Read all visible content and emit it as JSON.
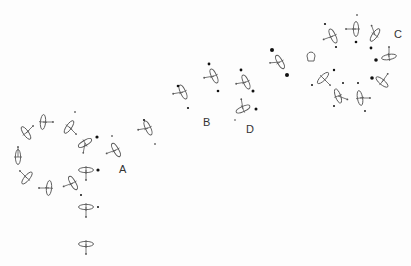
{
  "figure": {
    "labels": [
      {
        "text": "A",
        "x": 119,
        "y": 164
      },
      {
        "text": "B",
        "x": 203,
        "y": 117
      },
      {
        "text": "D",
        "x": 246,
        "y": 124
      },
      {
        "text": "C",
        "x": 394,
        "y": 29
      }
    ],
    "glyphs": [
      {
        "x": 18,
        "y": 157,
        "rot": 90,
        "lineAngle": -90
      },
      {
        "x": 26,
        "y": 133,
        "rot": 55,
        "lineAngle": -45
      },
      {
        "x": 43,
        "y": 122,
        "rot": 95,
        "lineAngle": 0
      },
      {
        "x": 69,
        "y": 127,
        "rot": 125,
        "lineAngle": 45
      },
      {
        "x": 85,
        "y": 143,
        "rot": 150,
        "lineAngle": 100
      },
      {
        "x": 116,
        "y": 150,
        "rot": 60,
        "lineAngle": 160
      },
      {
        "x": 86,
        "y": 170,
        "rot": 0,
        "lineAngle": 90
      },
      {
        "x": 73,
        "y": 183,
        "rot": 60,
        "lineAngle": 160
      },
      {
        "x": 49,
        "y": 188,
        "rot": 95,
        "lineAngle": 180
      },
      {
        "x": 27,
        "y": 178,
        "rot": 130,
        "lineAngle": -135
      },
      {
        "x": 86,
        "y": 207,
        "rot": 0,
        "lineAngle": 90
      },
      {
        "x": 86,
        "y": 244,
        "rot": 0,
        "lineAngle": 90
      },
      {
        "x": 148,
        "y": 128,
        "rot": 65,
        "lineAngle": 170
      },
      {
        "x": 183,
        "y": 92,
        "rot": 65,
        "lineAngle": 170
      },
      {
        "x": 214,
        "y": 76,
        "rot": 65,
        "lineAngle": 170
      },
      {
        "x": 243,
        "y": 109,
        "rot": -25,
        "lineAngle": -100
      },
      {
        "x": 246,
        "y": 82,
        "rot": 65,
        "lineAngle": 170
      },
      {
        "x": 280,
        "y": 62,
        "rot": 60,
        "lineAngle": 175
      },
      {
        "x": 333,
        "y": 36,
        "rot": 65,
        "lineAngle": 160
      },
      {
        "x": 356,
        "y": 29,
        "rot": 90,
        "lineAngle": 180
      },
      {
        "x": 375,
        "y": 35,
        "rot": -55,
        "lineAngle": -110
      },
      {
        "x": 389,
        "y": 57,
        "rot": -10,
        "lineAngle": -90
      },
      {
        "x": 382,
        "y": 82,
        "rot": 40,
        "lineAngle": -55
      },
      {
        "x": 360,
        "y": 98,
        "rot": 80,
        "lineAngle": 0
      },
      {
        "x": 338,
        "y": 96,
        "rot": 70,
        "lineAngle": 20
      },
      {
        "x": 323,
        "y": 78,
        "rot": -45,
        "lineAngle": 45
      }
    ],
    "dots": [
      {
        "x": 75,
        "y": 112,
        "r": 0.8
      },
      {
        "x": 97,
        "y": 137,
        "r": 1.6
      },
      {
        "x": 112,
        "y": 136,
        "r": 0.8
      },
      {
        "x": 98,
        "y": 170,
        "r": 1.6
      },
      {
        "x": 81,
        "y": 195,
        "r": 1.0
      },
      {
        "x": 98,
        "y": 207,
        "r": 1.0
      },
      {
        "x": 144,
        "y": 120,
        "r": 1.1
      },
      {
        "x": 155,
        "y": 144,
        "r": 0.8
      },
      {
        "x": 178,
        "y": 86,
        "r": 1.3
      },
      {
        "x": 188,
        "y": 108,
        "r": 1.1
      },
      {
        "x": 209,
        "y": 64,
        "r": 1.4
      },
      {
        "x": 218,
        "y": 91,
        "r": 1.3
      },
      {
        "x": 241,
        "y": 70,
        "r": 1.4
      },
      {
        "x": 253,
        "y": 91,
        "r": 1.5
      },
      {
        "x": 235,
        "y": 120,
        "r": 0.7
      },
      {
        "x": 256,
        "y": 109,
        "r": 1.5
      },
      {
        "x": 272,
        "y": 50,
        "r": 2.0
      },
      {
        "x": 287,
        "y": 75,
        "r": 2.0
      },
      {
        "x": 325,
        "y": 24,
        "r": 1.1
      },
      {
        "x": 336,
        "y": 47,
        "r": 1.1
      },
      {
        "x": 357,
        "y": 15,
        "r": 0.8
      },
      {
        "x": 356,
        "y": 42,
        "r": 1.3
      },
      {
        "x": 371,
        "y": 48,
        "r": 1.4
      },
      {
        "x": 376,
        "y": 60,
        "r": 1.8
      },
      {
        "x": 372,
        "y": 78,
        "r": 1.8
      },
      {
        "x": 334,
        "y": 70,
        "r": 1.2
      },
      {
        "x": 312,
        "y": 85,
        "r": 1.0
      },
      {
        "x": 343,
        "y": 83,
        "r": 1.0
      },
      {
        "x": 358,
        "y": 83,
        "r": 1.0
      },
      {
        "x": 334,
        "y": 106,
        "r": 1.0
      },
      {
        "x": 365,
        "y": 111,
        "r": 0.9
      }
    ],
    "special": [
      {
        "type": "cup-glyph",
        "x": 311,
        "y": 57
      }
    ]
  }
}
